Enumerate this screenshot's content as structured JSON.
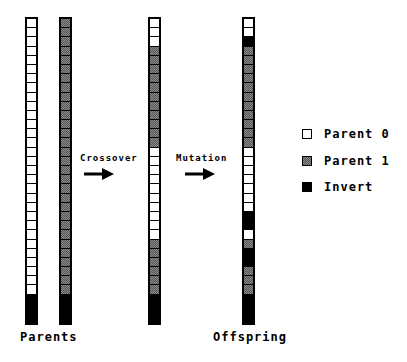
{
  "diagram": {
    "num_genes": 30,
    "columns": {
      "parent0": {
        "x": 25,
        "cells": "wwwwwwwwwwwwwwwwwwwwwwwwwwwwww"
      },
      "parent1": {
        "x": 59,
        "cells": "gggggggggggggggggggggggggggggg"
      },
      "crossover": {
        "x": 148,
        "cells": "wwwgggggggggggwwwwwwwwwwgggggg"
      },
      "offspring": {
        "x": 242,
        "cells": "wwbgggggggggggwwwwwwwbbwgbbggg"
      }
    },
    "labels": {
      "parents": "Parents",
      "offspring": "Offspring",
      "crossover": "Crossover",
      "mutation": "Mutation"
    },
    "legend": [
      {
        "key": "w",
        "label": "Parent 0"
      },
      {
        "key": "g",
        "label": "Parent 1"
      },
      {
        "key": "b",
        "label": "Invert"
      }
    ],
    "colors": {
      "parent0": "#ffffff",
      "parent1": "#8a8a8a",
      "invert": "#000000"
    }
  }
}
